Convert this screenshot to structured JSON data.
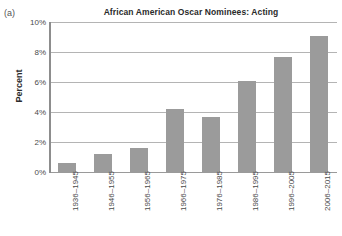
{
  "panel": {
    "label": "(a)"
  },
  "chart_data": {
    "type": "bar",
    "title": "African American Oscar Nominees: Acting",
    "xlabel": "",
    "ylabel": "Percent",
    "categories": [
      "1936–1945",
      "1946–1955",
      "1956–1965",
      "1966–1975",
      "1976–1985",
      "1986–1995",
      "1996–2005",
      "2006–2015"
    ],
    "values": [
      0.6,
      1.2,
      1.6,
      4.2,
      3.7,
      6.1,
      7.7,
      9.1
    ],
    "ylim": [
      0,
      10
    ],
    "ytick_values": [
      0,
      2,
      4,
      6,
      8,
      10
    ],
    "ytick_labels": [
      "0%",
      "2%",
      "4%",
      "6%",
      "8%",
      "10%"
    ],
    "grid": true,
    "legend": false,
    "bar_color": "#9b9b9b",
    "gridline_color": "#b4b4b4",
    "axis_color": "#8d8d8d"
  }
}
